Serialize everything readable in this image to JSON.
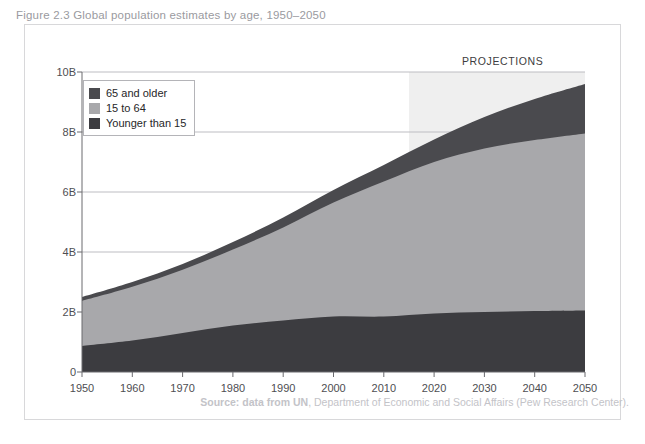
{
  "figure": {
    "title": "Figure 2.3  Global population estimates by age, 1950–2050",
    "source_prefix": "Source: data from UN",
    "source_rest": ", Department of Economic and Social Affairs (Pew Research Center)."
  },
  "annotations": {
    "projections_label": "PROJECTIONS"
  },
  "legend": {
    "items": [
      {
        "label": "65 and older",
        "color": "#4a4a4e"
      },
      {
        "label": "15 to 64",
        "color": "#a8a8ab"
      },
      {
        "label": "Younger than 15",
        "color": "#3c3c40"
      }
    ]
  },
  "colors": {
    "older": "#4a4a4e",
    "working": "#a8a8ab",
    "younger": "#3c3c40",
    "projection_band": "#efefef",
    "gridline": "#bdbdc2",
    "axis": "#6a6a6e",
    "border": "#d8d8da"
  },
  "chart_data": {
    "type": "area",
    "title": "Global population estimates by age, 1950–2050",
    "xlabel": "",
    "ylabel": "",
    "stacked": true,
    "grid": true,
    "legend_position": "top-left",
    "xlim": [
      1950,
      2050
    ],
    "ylim": [
      0,
      10
    ],
    "yunit": "billions",
    "ytick_labels": [
      "0",
      "2B",
      "4B",
      "6B",
      "8B",
      "10B"
    ],
    "ytick_values": [
      0,
      2,
      4,
      6,
      8,
      10
    ],
    "xtick_labels": [
      "1950",
      "1960",
      "1970",
      "1980",
      "1990",
      "2000",
      "2010",
      "2020",
      "2030",
      "2040",
      "2050"
    ],
    "x": [
      1950,
      1960,
      1970,
      1980,
      1990,
      2000,
      2010,
      2020,
      2030,
      2040,
      2050
    ],
    "projection_start": 2015,
    "series": [
      {
        "name": "Younger than 15",
        "color": "#3c3c40",
        "values": [
          0.87,
          1.05,
          1.3,
          1.55,
          1.72,
          1.85,
          1.85,
          1.95,
          2.0,
          2.03,
          2.05
        ]
      },
      {
        "name": "15 to 64",
        "color": "#a8a8ab",
        "values": [
          1.5,
          1.79,
          2.11,
          2.53,
          3.1,
          3.8,
          4.5,
          5.05,
          5.45,
          5.7,
          5.9
        ]
      },
      {
        "name": "65 and older",
        "color": "#4a4a4e",
        "values": [
          0.13,
          0.16,
          0.19,
          0.25,
          0.33,
          0.42,
          0.55,
          0.75,
          1.05,
          1.37,
          1.65
        ]
      }
    ],
    "totals": [
      2.5,
      3.0,
      3.6,
      4.33,
      5.15,
      6.07,
      6.9,
      7.75,
      8.5,
      9.1,
      9.6
    ]
  }
}
